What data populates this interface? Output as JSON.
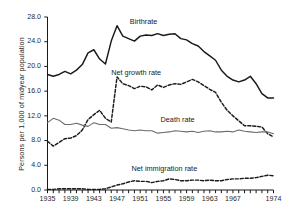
{
  "chart_data": {
    "type": "line",
    "title": "",
    "xlabel": "",
    "ylabel": "Persons per 1,000 of midyear population",
    "xlim": [
      1935,
      1974
    ],
    "ylim": [
      0.0,
      28.0
    ],
    "grid": false,
    "legend_position": "inline-annotations",
    "ytick_labels": [
      "0.0",
      "4.0",
      "8.0",
      "12.0",
      "16.0",
      "20.0",
      "24.0",
      "28.0"
    ],
    "ytick_values": [
      0.0,
      4.0,
      8.0,
      12.0,
      16.0,
      20.0,
      24.0,
      28.0
    ],
    "xtick_labels": [
      "1935",
      "1939",
      "1943",
      "1947",
      "1951",
      "1955",
      "1959",
      "1963",
      "1967",
      "1974"
    ],
    "xtick_values": [
      1935,
      1939,
      1943,
      1947,
      1951,
      1955,
      1959,
      1963,
      1967,
      1974
    ],
    "x": [
      1935,
      1936,
      1937,
      1938,
      1939,
      1940,
      1941,
      1942,
      1943,
      1944,
      1945,
      1946,
      1947,
      1948,
      1949,
      1950,
      1951,
      1952,
      1953,
      1954,
      1955,
      1956,
      1957,
      1958,
      1959,
      1960,
      1961,
      1962,
      1963,
      1964,
      1965,
      1966,
      1967,
      1968,
      1969,
      1970,
      1971,
      1972,
      1973,
      1974
    ],
    "series": [
      {
        "name": "Birthrate",
        "style": "solid",
        "color": "#1a1a1a",
        "label_x": 1949.2,
        "label_y": 27.2,
        "values": [
          18.7,
          18.4,
          18.7,
          19.2,
          18.8,
          19.4,
          20.3,
          22.2,
          22.7,
          21.2,
          20.4,
          24.1,
          26.6,
          24.9,
          24.5,
          24.1,
          24.9,
          25.1,
          25.0,
          25.3,
          25.0,
          25.2,
          25.3,
          24.5,
          24.3,
          23.7,
          23.3,
          22.4,
          21.7,
          21.0,
          19.4,
          18.4,
          17.8,
          17.5,
          17.8,
          18.4,
          17.2,
          15.6,
          14.9,
          14.9
        ]
      },
      {
        "name": "Net growth rate",
        "style": "dashed",
        "color": "#1a1a1a",
        "label_x": 1946.0,
        "label_y": 19.0,
        "values": [
          7.9,
          7.1,
          7.7,
          8.3,
          8.4,
          8.8,
          9.7,
          11.4,
          12.2,
          12.9,
          11.6,
          11.0,
          18.3,
          17.2,
          16.9,
          16.4,
          16.8,
          16.7,
          16.2,
          17.0,
          16.6,
          17.0,
          17.2,
          17.1,
          17.5,
          17.9,
          17.5,
          16.9,
          16.3,
          15.8,
          14.2,
          12.9,
          12.0,
          11.2,
          10.4,
          10.4,
          10.3,
          10.2,
          9.1,
          8.6
        ]
      },
      {
        "name": "Death rate",
        "style": "solid",
        "color": "#6b6b6b",
        "label_x": 1954.5,
        "label_y": 11.4,
        "values": [
          10.9,
          11.6,
          11.3,
          10.6,
          10.6,
          10.8,
          10.5,
          10.3,
          10.9,
          10.6,
          10.6,
          10.0,
          10.1,
          9.9,
          9.7,
          9.6,
          9.7,
          9.6,
          9.6,
          9.2,
          9.3,
          9.4,
          9.6,
          9.5,
          9.4,
          9.5,
          9.3,
          9.5,
          9.6,
          9.4,
          9.4,
          9.5,
          9.4,
          9.7,
          9.5,
          9.4,
          9.3,
          9.4,
          9.4,
          9.1
        ]
      },
      {
        "name": "Net immigration rate",
        "style": "dashed",
        "color": "#1a1a1a",
        "label_x": 1949.5,
        "label_y": 3.5,
        "values": [
          0.1,
          0.1,
          0.2,
          0.2,
          0.2,
          0.2,
          0.2,
          0.1,
          0.1,
          0.1,
          0.2,
          0.5,
          0.8,
          1.0,
          1.3,
          1.5,
          1.4,
          1.4,
          1.2,
          1.4,
          1.5,
          1.8,
          1.7,
          1.5,
          1.5,
          1.6,
          1.6,
          1.5,
          1.6,
          1.5,
          1.5,
          1.7,
          1.8,
          1.8,
          1.9,
          1.9,
          2.0,
          2.2,
          2.4,
          2.3
        ]
      }
    ]
  }
}
